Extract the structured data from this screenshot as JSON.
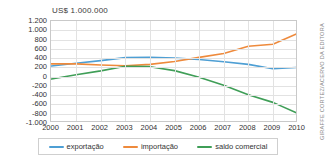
{
  "chart_data": {
    "type": "line",
    "title": "US$ 1.000.000",
    "xlabel": "",
    "ylabel": "",
    "x": [
      2000,
      2001,
      2002,
      2003,
      2004,
      2005,
      2006,
      2007,
      2008,
      2009,
      2010
    ],
    "categories": [
      "2000",
      "2001",
      "2002",
      "2003",
      "2004",
      "2005",
      "2006",
      "2007",
      "2008",
      "2009",
      "2010"
    ],
    "ylim": [
      -1000,
      1200
    ],
    "ytick_values": [
      1200,
      1000,
      800,
      600,
      400,
      200,
      0,
      -200,
      -400,
      -600,
      -800,
      -1000
    ],
    "ytick_labels": [
      "1.200",
      "1.000",
      "800",
      "600",
      "400",
      "200",
      "0",
      "-200",
      "-400",
      "-600",
      "-800",
      "-1.000"
    ],
    "grid": true,
    "legend_position": "bottom",
    "series": [
      {
        "name": "exportação",
        "color": "#4e9fd4",
        "values": [
          230,
          290,
          345,
          410,
          415,
          400,
          370,
          320,
          265,
          170,
          200
        ]
      },
      {
        "name": "importação",
        "color": "#ee8a3c",
        "values": [
          275,
          275,
          250,
          235,
          265,
          325,
          415,
          500,
          655,
          700,
          930
        ]
      },
      {
        "name": "saldo comercial",
        "color": "#3f9e57",
        "values": [
          -50,
          40,
          125,
          225,
          215,
          130,
          -15,
          -185,
          -390,
          -555,
          -790
        ]
      }
    ]
  },
  "credit": {
    "text": "GIRAFFE CORTEZ/ACERVO DA EDITORA"
  }
}
